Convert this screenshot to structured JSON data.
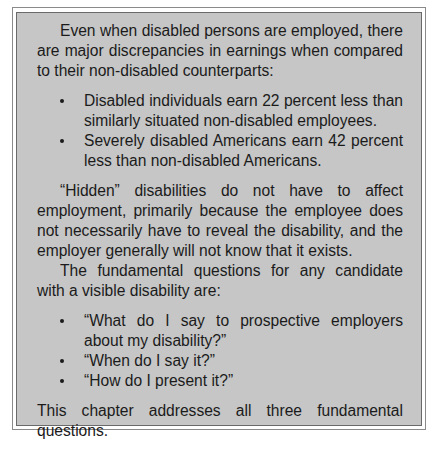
{
  "document": {
    "intro_paragraph": "Even when disabled persons are employed, there are major discrepancies in earnings when compared to their non-disabled counterparts:",
    "earnings_list": [
      "Disabled individuals earn 22 percent less than similarly situated non-disabled employees.",
      "Severely disabled Americans earn 42 percent less than non-disabled Americans."
    ],
    "hidden_paragraph": "“Hidden” disabilities do not have to affect employment, primarily because the employee does not necessarily have to reveal the disability, and the employer generally will not know that it exists.",
    "questions_intro": "The fundamental questions for any candidate with a visible disability are:",
    "questions_list": [
      "“What do I say to prospective employers about my disability?”",
      "“When do I say it?”",
      "“How do I present it?”"
    ],
    "closing": "This chapter addresses all three fundamental questions.",
    "colors": {
      "box_fill": "#c6c6c6",
      "text": "#1b1b1b",
      "border": "#6a6a6a"
    }
  }
}
